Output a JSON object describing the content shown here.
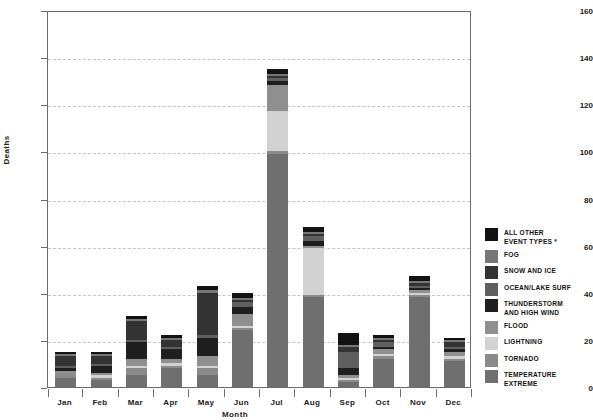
{
  "chart_data": {
    "type": "bar",
    "stacked": true,
    "title": "",
    "subtitle": "",
    "xlabel": "Month",
    "ylabel": "Deaths",
    "categories": [
      "Jan",
      "Feb",
      "Mar",
      "Apr",
      "May",
      "Jun",
      "Jul",
      "Aug",
      "Sep",
      "Oct",
      "Nov",
      "Dec"
    ],
    "ylim": [
      0,
      160
    ],
    "ytick_labels": [
      "0",
      "20",
      "40",
      "60",
      "80",
      "100",
      "120",
      "140",
      "160"
    ],
    "ytick_values": [
      0,
      20,
      40,
      60,
      80,
      100,
      120,
      140,
      160
    ],
    "grid": "horizontal-dashed",
    "legend_position": "right",
    "legend_note": "* asterisk on ALL OTHER EVENT TYPES",
    "series": [
      {
        "name": "TEMPERATURE EXTREME",
        "color": "#6f6f6f",
        "values": [
          4,
          3,
          5,
          8,
          5,
          24,
          99,
          38,
          2,
          12,
          38,
          11
        ]
      },
      {
        "name": "TORNADO",
        "color": "#8a8a8a",
        "values": [
          1,
          1,
          3,
          1,
          3,
          1,
          1,
          1,
          1,
          1,
          1,
          1
        ]
      },
      {
        "name": "LIGHTNING",
        "color": "#d2d2d2",
        "values": [
          0,
          1,
          1,
          1,
          1,
          1,
          17,
          20,
          1,
          1,
          1,
          1
        ]
      },
      {
        "name": "FLOOD",
        "color": "#8f8f8f",
        "values": [
          2,
          1,
          3,
          2,
          4,
          5,
          11,
          1,
          1,
          2,
          1,
          2
        ]
      },
      {
        "name": "THUNDERSTORM AND HIGH WIND",
        "color": "#1f1f1f",
        "values": [
          1,
          3,
          7,
          4,
          8,
          3,
          2,
          2,
          3,
          1,
          1,
          1
        ]
      },
      {
        "name": "OCEAN/LAKE SURF",
        "color": "#5f5f5f",
        "values": [
          1,
          1,
          1,
          1,
          1,
          2,
          1,
          2,
          7,
          2,
          1,
          1
        ]
      },
      {
        "name": "SNOW AND ICE",
        "color": "#333333",
        "values": [
          4,
          3,
          8,
          3,
          18,
          1,
          1,
          1,
          2,
          1,
          1,
          2
        ]
      },
      {
        "name": "FOG",
        "color": "#777777",
        "values": [
          1,
          1,
          1,
          1,
          1,
          1,
          1,
          1,
          1,
          1,
          1,
          1
        ]
      },
      {
        "name": "ALL OTHER EVENT TYPES *",
        "color": "#121212",
        "values": [
          1,
          1,
          1,
          1,
          2,
          2,
          2,
          2,
          5,
          1,
          2,
          1
        ]
      }
    ],
    "totals": [
      15,
      15,
      30,
      22,
      43,
      40,
      135,
      68,
      23,
      22,
      47,
      21
    ]
  },
  "legend": {
    "items": [
      {
        "label": "ALL OTHER\nEVENT TYPES *",
        "color": "#121212"
      },
      {
        "label": "FOG",
        "color": "#777777"
      },
      {
        "label": "SNOW AND ICE",
        "color": "#333333"
      },
      {
        "label": "OCEAN/LAKE SURF",
        "color": "#5f5f5f"
      },
      {
        "label": "THUNDERSTORM\nAND HIGH WIND",
        "color": "#1f1f1f"
      },
      {
        "label": "FLOOD",
        "color": "#8f8f8f"
      },
      {
        "label": "LIGHTNING",
        "color": "#d2d2d2"
      },
      {
        "label": "TORNADO",
        "color": "#8a8a8a"
      },
      {
        "label": "TEMPERATURE\nEXTREME",
        "color": "#6f6f6f"
      }
    ]
  }
}
